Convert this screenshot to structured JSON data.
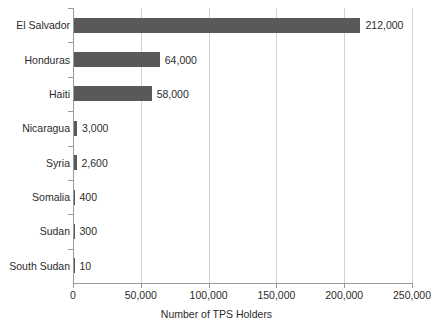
{
  "chart_data": {
    "type": "bar",
    "orientation": "horizontal",
    "title": "",
    "xlabel": "Number of TPS Holders",
    "ylabel": "",
    "categories": [
      "El Salvador",
      "Honduras",
      "Haiti",
      "Nicaragua",
      "Syria",
      "Somalia",
      "Sudan",
      "South Sudan"
    ],
    "values": [
      212000,
      64000,
      58000,
      3000,
      2600,
      400,
      300,
      10
    ],
    "value_labels": [
      "212,000",
      "64,000",
      "58,000",
      "3,000",
      "2,600",
      "400",
      "300",
      "10"
    ],
    "xlim": [
      0,
      250000
    ],
    "xticks": [
      0,
      50000,
      100000,
      150000,
      200000,
      250000
    ],
    "xtick_labels": [
      "0",
      "50,000",
      "100,000",
      "150,000",
      "200,000",
      "250,000"
    ],
    "grid": true,
    "grid_axis": "x",
    "legend": false,
    "bar_color": "#595959",
    "gridline_color": "#d0d0d0",
    "axis_color": "#9a9a9a",
    "text_color": "#2b2b2b"
  }
}
